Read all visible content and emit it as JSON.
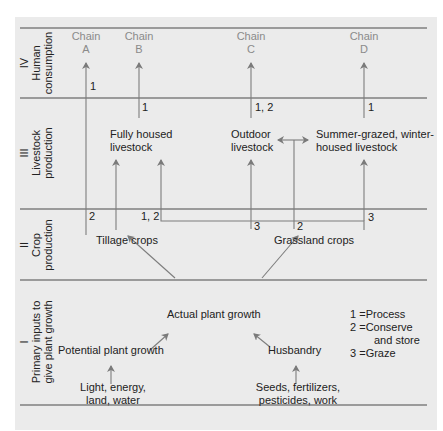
{
  "levels": [
    {
      "numeral": "IV",
      "label_line1": "Human",
      "label_line2": "consumption"
    },
    {
      "numeral": "III",
      "label_line1": "Livestock",
      "label_line2": "production"
    },
    {
      "numeral": "II",
      "label_line1": "Crop",
      "label_line2": "production"
    },
    {
      "numeral": "I",
      "label_line1": "Primary inputs to",
      "label_line2": "give plant growth"
    }
  ],
  "chains": [
    {
      "word": "Chain",
      "letter": "A"
    },
    {
      "word": "Chain",
      "letter": "B"
    },
    {
      "word": "Chain",
      "letter": "C"
    },
    {
      "word": "Chain",
      "letter": "D"
    }
  ],
  "nodes": {
    "fully_housed_1": "Fully housed",
    "fully_housed_2": "livestock",
    "outdoor_1": "Outdoor",
    "outdoor_2": "livestock",
    "summer_1": "Summer-grazed, winter-",
    "summer_2": "housed livestock",
    "tillage": "Tillage crops",
    "grassland": "Grassland crops",
    "actual": "Actual plant growth",
    "potential": "Potential plant growth",
    "husbandry": "Husbandry",
    "light_1": "Light, energy,",
    "light_2": "land, water",
    "seeds_1": "Seeds, fertilizers,",
    "seeds_2": "pesticides, work"
  },
  "edge_labels": {
    "a_iv": "1",
    "b_iii": "1",
    "c_iii": "1, 2",
    "d_iii": "1",
    "a_ii": "2",
    "tillage_ii": "1, 2",
    "c_ii": "3",
    "grass_ii": "2",
    "d_ii": "3"
  },
  "legend": [
    {
      "num": "1",
      "eq": "=",
      "text": "Process"
    },
    {
      "num": "2",
      "eq": "=",
      "text": "Conserve",
      "text2": "and store"
    },
    {
      "num": "3",
      "eq": "=",
      "text": "Graze"
    }
  ],
  "colors": {
    "panel": "#ebebeb",
    "line": "#555555",
    "arrow": "#888888",
    "chain_text": "#8a8a8a"
  }
}
